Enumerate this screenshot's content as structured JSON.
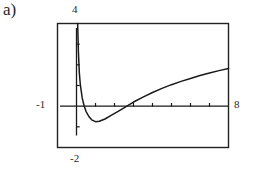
{
  "figure": {
    "part_label": "a)",
    "caption": ""
  },
  "chart_data": {
    "type": "line",
    "title": "",
    "xlabel": "",
    "ylabel": "",
    "xlim": [
      -1,
      8
    ],
    "ylim": [
      -2,
      4
    ],
    "grid": false,
    "legend": null,
    "axis_labels": {
      "x_min": "-1",
      "x_max": "8",
      "y_min": "-2",
      "y_max": "4"
    },
    "x_tick_step": 1,
    "y_tick_step": 1,
    "x_ticks": [
      -1,
      0,
      1,
      2,
      3,
      4,
      5,
      6,
      7,
      8
    ],
    "y_ticks": [
      -2,
      -1,
      0,
      1,
      2,
      3,
      4
    ],
    "series": [
      {
        "name": "curve",
        "color": "#1a1a1a",
        "x": [
          0.06,
          0.1,
          0.15,
          0.2,
          0.3,
          0.4,
          0.5,
          0.65,
          0.8,
          1.0,
          1.2,
          1.5,
          1.8,
          2.1,
          2.5,
          3.0,
          3.5,
          4.0,
          4.5,
          5.0,
          5.5,
          6.0,
          6.5,
          7.0,
          7.5,
          8.0
        ],
        "y": [
          4.0,
          2.65,
          1.6,
          1.05,
          0.4,
          0.02,
          -0.25,
          -0.5,
          -0.66,
          -0.75,
          -0.73,
          -0.62,
          -0.46,
          -0.3,
          -0.08,
          0.2,
          0.44,
          0.66,
          0.86,
          1.04,
          1.2,
          1.34,
          1.48,
          1.6,
          1.72,
          1.82
        ]
      }
    ]
  },
  "colors": {
    "ink": "#1a1a1a",
    "frame": "#222222",
    "background": "#ffffff"
  }
}
